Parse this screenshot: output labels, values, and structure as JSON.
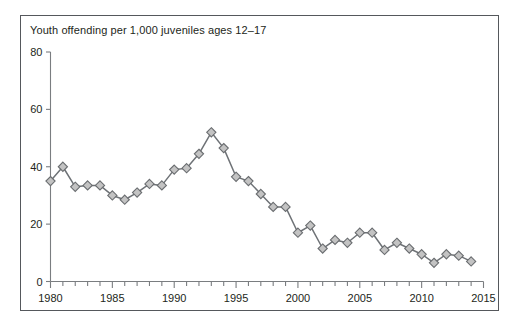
{
  "chart_data": {
    "type": "line",
    "title": "Youth offending per 1,000 juveniles ages 12–17",
    "xlabel": "",
    "ylabel": "",
    "xlim": [
      1980,
      2015
    ],
    "ylim": [
      0,
      80
    ],
    "yticks": [
      0,
      20,
      40,
      60,
      80
    ],
    "ytick_labels": [
      "0",
      "20",
      "40",
      "60",
      "80"
    ],
    "xticks": [
      1980,
      1985,
      1990,
      1995,
      2000,
      2005,
      2010,
      2015
    ],
    "xtick_labels": [
      "1980",
      "1985",
      "1990",
      "1995",
      "2000",
      "2005",
      "2010",
      "2015"
    ],
    "minor_xtick_interval": 1,
    "grid": false,
    "legend": false,
    "marker": "diamond",
    "marker_fill_color": "#c3c3c3",
    "marker_edge_color": "#6a6d70",
    "line_color": "#6e7276",
    "x": [
      1980,
      1981,
      1982,
      1983,
      1984,
      1985,
      1986,
      1987,
      1988,
      1989,
      1990,
      1991,
      1992,
      1993,
      1994,
      1995,
      1996,
      1997,
      1998,
      1999,
      2000,
      2001,
      2002,
      2003,
      2004,
      2005,
      2006,
      2007,
      2008,
      2009,
      2010,
      2011,
      2012,
      2013,
      2014
    ],
    "values": [
      35,
      40,
      33,
      33.5,
      33.5,
      30,
      28.5,
      31,
      34,
      33.5,
      39,
      39.5,
      44.5,
      52,
      46.5,
      36.5,
      35,
      30.5,
      26,
      26,
      17,
      19.5,
      11.5,
      14.5,
      13.5,
      17,
      17,
      11,
      13.5,
      11.5,
      9.5,
      6.5,
      9.5,
      9,
      7
    ]
  }
}
